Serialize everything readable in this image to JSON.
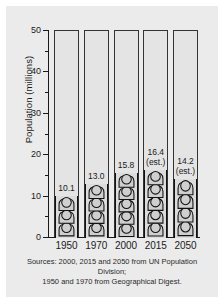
{
  "chart_data": {
    "type": "bar",
    "title": "",
    "subtitle": "",
    "xlabel": "",
    "ylabel": "Population (millions)",
    "categories": [
      "1950",
      "1970",
      "2000",
      "2015",
      "2050"
    ],
    "values": [
      10.1,
      13.0,
      15.8,
      16.4,
      14.2
    ],
    "point_labels": [
      "10.1",
      "13.0",
      "15.8",
      "16.4",
      "14.2"
    ],
    "point_sublabels": [
      "",
      "",
      "",
      "(est.)",
      "(est.)"
    ],
    "series": [
      {
        "name": "Population",
        "values": [
          10.1,
          13.0,
          15.8,
          16.4,
          14.2
        ]
      }
    ],
    "ylim": [
      0,
      50
    ],
    "ytick_values": [
      0,
      10,
      20,
      30,
      40,
      50
    ],
    "ytick_labels": [
      "0",
      "10",
      "20",
      "30",
      "40",
      "50"
    ],
    "yminor_values": [
      5,
      15,
      25,
      35,
      45
    ],
    "grid": false,
    "legend": false,
    "legend_position": "none",
    "glyph": "person-icon",
    "annotations": [
      "Sources: 2000, 2015 and 2050 from UN Population Division;",
      "1950 and 1970 from Geographical Digest."
    ]
  },
  "source_note": {
    "line1": "Sources: 2000, 2015 and 2050 from UN Population Division;",
    "line2": "1950 and 1970 from Geographical Digest."
  },
  "colors": {
    "background": "#ebebeb",
    "page": "#ffffff",
    "axis": "#1a1a1a",
    "frame": "#333333",
    "bar_fill": "#dcdcdc",
    "glyph_fill": "#cfcfcf",
    "glyph_stroke": "#111111",
    "text": "#1a1a1a"
  }
}
